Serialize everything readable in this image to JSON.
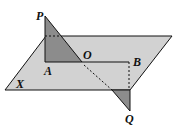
{
  "diagram": {
    "labels": {
      "P": "P",
      "A": "A",
      "O": "O",
      "B": "B",
      "X": "X",
      "Q": "Q"
    },
    "colors": {
      "plane_fill": "#d2d2d2",
      "triangle_fill": "#8c8c8c",
      "stroke": "#111111",
      "background": "#ffffff"
    }
  }
}
